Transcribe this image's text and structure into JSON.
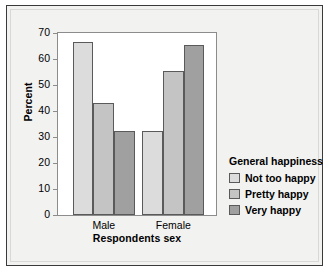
{
  "chart_data": {
    "type": "bar",
    "title": "",
    "xlabel": "Respondents sex",
    "ylabel": "Percent",
    "categories": [
      "Male",
      "Female"
    ],
    "series": [
      {
        "name": "Not too happy",
        "values": [
          66.5,
          32.5
        ],
        "color": "#dcdcdc"
      },
      {
        "name": "Pretty happy",
        "values": [
          43.0,
          55.5
        ],
        "color": "#c4c4c4"
      },
      {
        "name": "Very happy",
        "values": [
          32.5,
          65.5
        ],
        "color": "#a0a0a0"
      }
    ],
    "legend_title": "General happiness",
    "legend_position": "right",
    "ylim": [
      0,
      70
    ],
    "yticks": [
      "0",
      "10",
      "20",
      "30",
      "40",
      "50",
      "60",
      "70"
    ],
    "grid": false
  },
  "axes": {
    "y_title": "Percent",
    "x_title": "Respondents sex"
  }
}
